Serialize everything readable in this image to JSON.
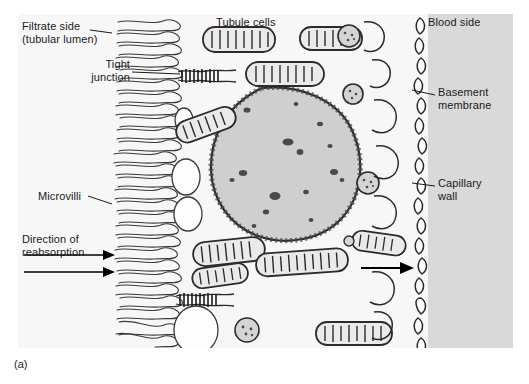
{
  "figure": {
    "caption": "(a)",
    "panel_bg": "#f7f7f7",
    "blood_side_bg": "#d9d9d9",
    "nucleus_fill": "#cfcfcf",
    "line_color": "#2b2b2b"
  },
  "labels": {
    "filtrate_side_line1": "Filtrate side",
    "filtrate_side_line2": "(tubular lumen)",
    "tight_junction_line1": "Tight",
    "tight_junction_line2": "junction",
    "microvilli": "Microvilli",
    "direction_line1": "Direction of",
    "direction_line2": "reabsorption",
    "tubule_cells": "Tubule cells",
    "blood_side": "Blood side",
    "basement_membrane_line1": "Basement",
    "basement_membrane_line2": "membrane",
    "capillary_wall_line1": "Capillary",
    "capillary_wall_line2": "wall"
  },
  "diagram_content": {
    "type": "biological-illustration",
    "subject": "Kidney tubule cell reabsorption across the tubular epithelium",
    "regions": [
      {
        "name": "filtrate-side",
        "description": "tubular lumen on the left, white background"
      },
      {
        "name": "tubule-cell-cytoplasm",
        "description": "central cell body with organelles"
      },
      {
        "name": "blood-side",
        "description": "shaded gray region on the right"
      }
    ],
    "structures": [
      {
        "name": "microvilli",
        "description": "dense wavy brush-border folds along left cell surface"
      },
      {
        "name": "tight-junction",
        "description": "dark zipper-like junctions between adjacent cells, upper and lower"
      },
      {
        "name": "nucleus",
        "description": "large round nucleus with speckled chromatin, center of cell"
      },
      {
        "name": "mitochondria",
        "description": "elongated oval organelles with internal cristae bands"
      },
      {
        "name": "vesicles",
        "description": "clear round vacuoles near the lumen side"
      },
      {
        "name": "basement-membrane",
        "description": "segmented dashed boundary along the blood side"
      },
      {
        "name": "capillary-wall",
        "description": "interdigitated basal infoldings adjacent to the blood side"
      },
      {
        "name": "reabsorption-arrows",
        "description": "two arrows pointing right from filtrate side, one arrow exiting to blood side"
      }
    ]
  }
}
